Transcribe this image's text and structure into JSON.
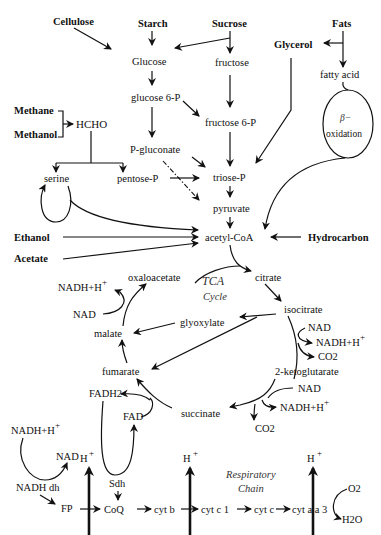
{
  "sources": {
    "cellulose": "Cellulose",
    "starch": "Starch",
    "sucrose": "Sucrose",
    "fats": "Fats",
    "glycerol": "Glycerol",
    "methane": "Methane",
    "methanol": "Methanol",
    "ethanol": "Ethanol",
    "acetate": "Acetate",
    "hydrocarbon": "Hydrocarbon"
  },
  "metabolites": {
    "glucose": "Glucose",
    "fructose": "fructose",
    "fatty_acid": "fatty acid",
    "glucose6p": "glucose 6-P",
    "fructose6p": "fructose 6-P",
    "hcho": "HCHO",
    "pgluconate": "P-gluconate",
    "serine": "serine",
    "pentosep": "pentose-P",
    "triosep": "triose-P",
    "pyruvate": "pyruvate",
    "acetylcoa": "acetyl-CoA",
    "beta": "β−",
    "oxidation": "oxidation"
  },
  "tca": {
    "title_line1": "TCA",
    "title_line2": "Cycle",
    "citrate": "citrate",
    "isocitrate": "isocitrate",
    "oxaloacetate": "oxaloacetate",
    "glyoxylate": "glyoxylate",
    "malate": "malate",
    "fumarate": "fumarate",
    "succinate": "succinate",
    "ketoglutarate": "2-ketoglutarate",
    "nad_1": "NAD",
    "nadh_1": "NADH+H",
    "nad_2": "NAD",
    "nadh_2": "NADH+H",
    "co2_1": "CO2",
    "nad_3": "NAD",
    "nadh_3": "NADH+H",
    "co2_2": "CO2",
    "fadh2": "FADH2",
    "fad": "FAD",
    "plus": "+"
  },
  "respiratory_chain": {
    "title_line1": "Respiratory",
    "title_line2": "Chain",
    "nadh": "NADH+H",
    "nad": "NAD",
    "nadh_dh": "NADH dh",
    "fp": "FP",
    "sdh": "Sdh",
    "coq": "CoQ",
    "cyt_b": "cyt b",
    "cyt_c1": "cyt c 1",
    "cyt_c": "cyt c",
    "cyt_aa3": "cyt a a 3",
    "h_plus": "H",
    "plus": "+",
    "o2": "O2",
    "h2o": "H2O"
  }
}
